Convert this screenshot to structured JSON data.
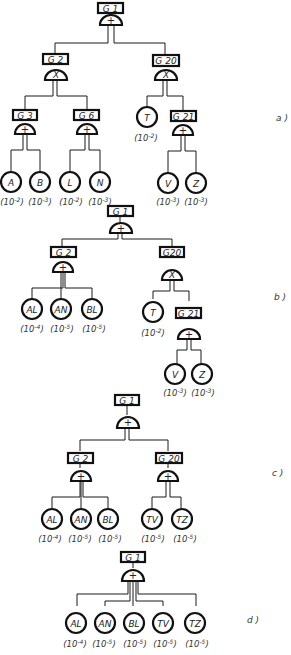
{
  "diagrams": [
    {
      "id": "a",
      "panel_label": "a )",
      "top_event": "G1",
      "nodes": {
        "G1": {
          "label": "G 1",
          "gate": "+"
        },
        "G2": {
          "label": "G 2",
          "gate": "X"
        },
        "G20": {
          "label": "G 20",
          "gate": "X"
        },
        "G3": {
          "label": "G 3",
          "gate": "+"
        },
        "G6": {
          "label": "G 6",
          "gate": "+"
        },
        "G21": {
          "label": "G 21",
          "gate": "+"
        },
        "T": {
          "label": "T",
          "prob": "10",
          "exp": "-2"
        },
        "A": {
          "label": "A",
          "prob": "10",
          "exp": "-2"
        },
        "B": {
          "label": "B",
          "prob": "10",
          "exp": "-3"
        },
        "L": {
          "label": "L",
          "prob": "10",
          "exp": "-2"
        },
        "N": {
          "label": "N",
          "prob": "10",
          "exp": "-3"
        },
        "V": {
          "label": "V",
          "prob": "10",
          "exp": "-3"
        },
        "Z": {
          "label": "Z",
          "prob": "10",
          "exp": "-3"
        }
      }
    },
    {
      "id": "b",
      "panel_label": "b )",
      "top_event": "G1",
      "nodes": {
        "G1": {
          "label": "G 1",
          "gate": "+"
        },
        "G2": {
          "label": "G 2",
          "gate": "+"
        },
        "G20": {
          "label": "G20",
          "gate": "X"
        },
        "G21": {
          "label": "G 21",
          "gate": "+"
        },
        "AL": {
          "label": "AL",
          "prob": "10",
          "exp": "-4"
        },
        "AN": {
          "label": "AN",
          "prob": "10",
          "exp": "-5"
        },
        "BL": {
          "label": "BL",
          "prob": "10",
          "exp": "-5"
        },
        "T": {
          "label": "T",
          "prob": "10",
          "exp": "-2"
        },
        "V": {
          "label": "V",
          "prob": "10",
          "exp": "-3"
        },
        "Z": {
          "label": "Z",
          "prob": "10",
          "exp": "-3"
        }
      }
    },
    {
      "id": "c",
      "panel_label": "c )",
      "top_event": "G1",
      "nodes": {
        "G1": {
          "label": "G 1",
          "gate": "+"
        },
        "G2": {
          "label": "G 2",
          "gate": "+"
        },
        "G20": {
          "label": "G 20",
          "gate": "+"
        },
        "AL": {
          "label": "AL",
          "prob": "10",
          "exp": "-4"
        },
        "AN": {
          "label": "AN",
          "prob": "10",
          "exp": "-5"
        },
        "BL": {
          "label": "BL",
          "prob": "10",
          "exp": "-5"
        },
        "TV": {
          "label": "TV",
          "prob": "10",
          "exp": "-5"
        },
        "TZ": {
          "label": "TZ",
          "prob": "10",
          "exp": "-5"
        }
      }
    },
    {
      "id": "d",
      "panel_label": "d )",
      "top_event": "G1",
      "nodes": {
        "G1": {
          "label": "G 1",
          "gate": "+"
        },
        "AL": {
          "label": "AL",
          "prob": "10",
          "exp": "-4"
        },
        "AN": {
          "label": "AN",
          "prob": "10",
          "exp": "-5"
        },
        "BL": {
          "label": "BL",
          "prob": "10",
          "exp": "-5"
        },
        "TV": {
          "label": "TV",
          "prob": "10",
          "exp": "-5"
        },
        "TZ": {
          "label": "TZ",
          "prob": "10",
          "exp": "-5"
        }
      }
    }
  ],
  "legend": {
    "or_gate_symbol": "+",
    "and_gate_symbol": "X"
  }
}
